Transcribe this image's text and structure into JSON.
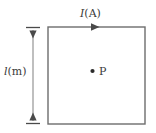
{
  "figure": {
    "type": "physics-diagram",
    "background_color": "#ffffff",
    "labels": {
      "current": {
        "symbol": "I",
        "unit": "(A)",
        "full": "I(A)"
      },
      "side_length": {
        "symbol": "l",
        "unit": "(m)",
        "full": "l(m)"
      },
      "point": {
        "symbol": "P",
        "full": "P"
      }
    },
    "colors": {
      "wire": "#6d6d6d",
      "arrow": "#4a4a4a",
      "dimension_line": "#8a8a8a",
      "text": "#3a3a3a",
      "point_dot": "#2b2b2b"
    },
    "geometry": {
      "square": {
        "left": 48,
        "top": 27,
        "right": 145,
        "bottom": 124
      },
      "current_arrow": {
        "x": 96,
        "y": 27,
        "direction": "right"
      },
      "point_P": {
        "x": 92,
        "y": 71
      },
      "dimension_arrow": {
        "x": 33,
        "top": 27,
        "bottom": 124,
        "direction": "both"
      }
    }
  }
}
